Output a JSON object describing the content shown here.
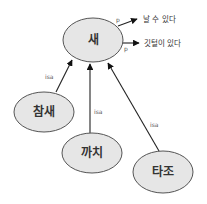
{
  "colors": {
    "node_fill": "#e6e6e6",
    "node_stroke": "#555555",
    "edge": "#222222"
  },
  "nodes": {
    "bird": {
      "label": "새"
    },
    "sparrow": {
      "label": "참새"
    },
    "magpie": {
      "label": "까치"
    },
    "ostrich": {
      "label": "타조"
    }
  },
  "properties": {
    "can_fly": {
      "label": "날 수 있다",
      "relation": "p"
    },
    "has_feathers": {
      "label": "깃털이 있다",
      "relation": "p"
    }
  },
  "edges": {
    "sparrow_isa": {
      "label": "isa"
    },
    "magpie_isa": {
      "label": "isa"
    },
    "ostrich_isa": {
      "label": "isa"
    }
  }
}
